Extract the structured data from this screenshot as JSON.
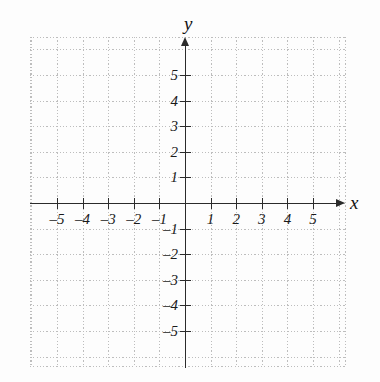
{
  "figure": {
    "kind": "cartesian-coordinate-plane",
    "width": 380,
    "height": 382,
    "background_color": "#fdfdfd"
  },
  "axes": {
    "x_name": "x",
    "y_name": "y",
    "axis_color": "#2b2b2b",
    "grid_color": "#bdbdbd",
    "label_color": "#1a1a1a",
    "x_arrow": "arrow-right-icon",
    "y_arrow": "arrow-up-icon"
  },
  "chart_data": {
    "type": "scatter",
    "title": "",
    "xlabel": "x",
    "ylabel": "y",
    "xlim": [
      -6.1,
      6.25
    ],
    "ylim": [
      -6.5,
      6.5
    ],
    "grid": true,
    "grid_style": "dotted",
    "grid_spacing": 1,
    "legend": "none",
    "series": [],
    "x_ticks": [
      -5,
      -4,
      -3,
      -2,
      -1,
      1,
      2,
      3,
      4,
      5
    ],
    "y_ticks": [
      5,
      4,
      3,
      2,
      1,
      -1,
      -2,
      -3,
      -4,
      -5
    ],
    "x_tick_labels": [
      "–5",
      "–4",
      "–3",
      "–2",
      "–1",
      "1",
      "2",
      "3",
      "4",
      "5"
    ],
    "y_tick_labels": [
      "5",
      "4",
      "3",
      "2",
      "1",
      "–1",
      "–2",
      "–3",
      "–4",
      "–5"
    ],
    "origin_label": "",
    "note": "Empty grid with no plotted data points"
  },
  "ticks": {
    "x": [
      {
        "value": -5,
        "label": "–5"
      },
      {
        "value": -4,
        "label": "–4"
      },
      {
        "value": -3,
        "label": "–3"
      },
      {
        "value": -2,
        "label": "–2"
      },
      {
        "value": -1,
        "label": "–1"
      },
      {
        "value": 1,
        "label": "1"
      },
      {
        "value": 2,
        "label": "2"
      },
      {
        "value": 3,
        "label": "3"
      },
      {
        "value": 4,
        "label": "4"
      },
      {
        "value": 5,
        "label": "5"
      }
    ],
    "y": [
      {
        "value": 5,
        "label": "5"
      },
      {
        "value": 4,
        "label": "4"
      },
      {
        "value": 3,
        "label": "3"
      },
      {
        "value": 2,
        "label": "2"
      },
      {
        "value": 1,
        "label": "1"
      },
      {
        "value": -1,
        "label": "–1"
      },
      {
        "value": -2,
        "label": "–2"
      },
      {
        "value": -3,
        "label": "–3"
      },
      {
        "value": -4,
        "label": "–4"
      },
      {
        "value": -5,
        "label": "–5"
      }
    ]
  }
}
